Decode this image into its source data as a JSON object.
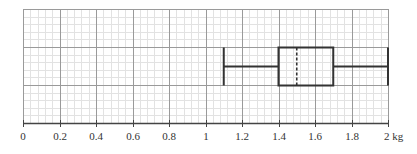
{
  "chart_data": {
    "type": "boxplot",
    "title": "",
    "xlabel": "kg",
    "ylabel": "",
    "xlim": [
      0,
      2
    ],
    "x_ticks": [
      0,
      0.2,
      0.4,
      0.6,
      0.8,
      1,
      1.2,
      1.4,
      1.6,
      1.8,
      2
    ],
    "x_tick_labels": [
      "0",
      "0.2",
      "0.4",
      "0.6",
      "0.8",
      "1",
      "1.2",
      "1.4",
      "1.6",
      "1.8",
      "2 kg"
    ],
    "grid": true,
    "grid_style": "graph paper (major every 0.2, minor every 0.02)",
    "series": [
      {
        "name": "weights",
        "min": 1.1,
        "q1": 1.4,
        "median": 1.5,
        "q3": 1.7,
        "max": 2.0,
        "median_style": "dashed"
      }
    ]
  },
  "colors": {
    "box_stroke": "#333333",
    "major_grid": "#9a9a9a",
    "minor_grid": "#e2e2e2",
    "axis": "#444444"
  }
}
